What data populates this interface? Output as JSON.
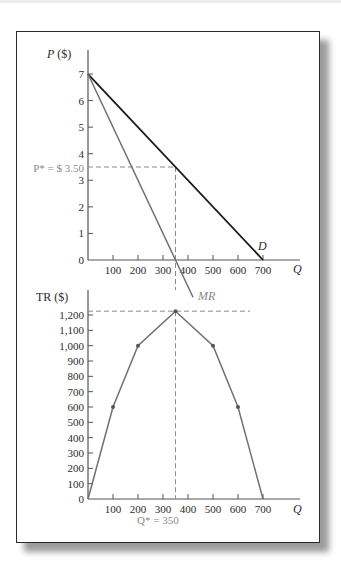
{
  "chart_data": [
    {
      "type": "line",
      "title": "Demand and Marginal Revenue",
      "xlabel": "Q",
      "ylabel": "P ($)",
      "xlim": [
        0,
        800
      ],
      "ylim": [
        0,
        7
      ],
      "x_ticks": [
        100,
        200,
        300,
        400,
        500,
        600,
        700
      ],
      "x_tick_labels": [
        "100",
        "200",
        "300",
        "400",
        "500",
        "600",
        "700"
      ],
      "y_ticks": [
        0,
        1,
        2,
        3,
        4,
        5,
        6,
        7
      ],
      "y_tick_labels": [
        "0",
        "1",
        "2",
        "3",
        "4",
        "5",
        "6",
        "7"
      ],
      "series": [
        {
          "name": "D",
          "color": "#1a1a1a",
          "points": [
            [
              0,
              7
            ],
            [
              700,
              0
            ]
          ]
        },
        {
          "name": "MR",
          "color": "#707070",
          "points": [
            [
              0,
              7
            ],
            [
              350,
              0
            ],
            [
              420,
              -1.4
            ]
          ]
        }
      ],
      "annotations": [
        {
          "text": "P* = $ 3.50",
          "type": "hline-dashed",
          "y": 3.5,
          "x_to": 350,
          "color": "#8a8a8a"
        },
        {
          "text": "",
          "type": "vline-dashed",
          "x": 350,
          "color": "#8a8a8a"
        }
      ],
      "grid": false
    },
    {
      "type": "line",
      "title": "Total Revenue",
      "xlabel": "Q",
      "ylabel": "TR ($)",
      "xlim": [
        0,
        800
      ],
      "ylim": [
        0,
        1200
      ],
      "x_ticks": [
        100,
        200,
        300,
        400,
        500,
        600,
        700
      ],
      "x_tick_labels": [
        "100",
        "200",
        "300",
        "400",
        "500",
        "600",
        "700"
      ],
      "y_ticks": [
        0,
        100,
        200,
        300,
        400,
        500,
        600,
        700,
        800,
        900,
        1000,
        1100,
        1200
      ],
      "y_tick_labels": [
        "0",
        "100",
        "200",
        "300",
        "400",
        "500",
        "600",
        "700",
        "800",
        "900",
        "1,000",
        "1,100",
        "1,200"
      ],
      "series": [
        {
          "name": "TR",
          "color": "#707070",
          "points": [
            [
              0,
              0
            ],
            [
              100,
              600
            ],
            [
              200,
              1000
            ],
            [
              350,
              1225
            ],
            [
              500,
              1000
            ],
            [
              600,
              600
            ],
            [
              700,
              0
            ]
          ]
        }
      ],
      "annotations": [
        {
          "text": "Q* = 350",
          "type": "vline-dashed",
          "x": 350,
          "color": "#8a8a8a"
        },
        {
          "text": "",
          "type": "hline-dashed",
          "y": 1225,
          "color": "#8a8a8a"
        }
      ],
      "grid": false
    }
  ],
  "labels": {
    "top_ylabel_var": "P",
    "top_ylabel_unit": " ($)",
    "bottom_ylabel": "TR ($)",
    "xlabel": "Q",
    "demand": "D",
    "mr": "MR",
    "pstar": "P* = $ 3.50",
    "qstar": "Q* = 350"
  }
}
